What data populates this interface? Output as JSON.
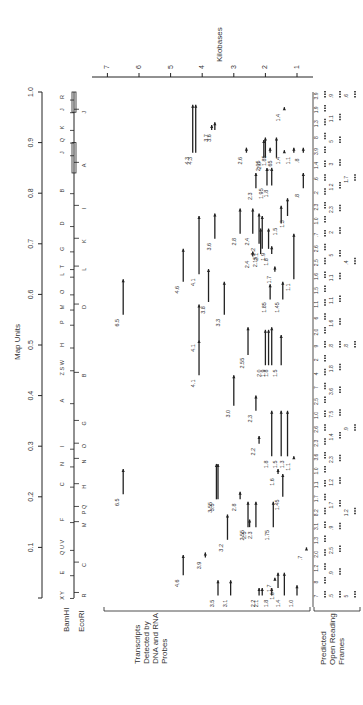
{
  "figure": {
    "map_units_label": "Map Units",
    "kilobases_label": "Kilobases",
    "bamhi_label": "BamHI",
    "ecori_label": "EcoRI",
    "transcripts_label": [
      "Transcripts",
      "Detected by",
      "DNA and RNA",
      "Probes"
    ],
    "orf_label": [
      "Predicted",
      "Open Reading",
      "Frames"
    ]
  },
  "map_units_axis": {
    "ticks": [
      "0",
      "0.1",
      "0.2",
      "0.3",
      "0.4",
      "0.5",
      "0.6",
      "0.7",
      "0.8",
      "0.9",
      "1.0"
    ],
    "tick_labels_shown": [
      "0.1",
      "0.2",
      "0.3",
      "0.4",
      "0.5",
      "0.6",
      "0.7",
      "0.8",
      "0.9",
      "1.0"
    ]
  },
  "kilobase_axis": {
    "ticks": [
      "7",
      "6",
      "5",
      "4",
      "3",
      "2",
      "1"
    ]
  },
  "bamhi_fragments": [
    {
      "label": "X Y",
      "pos": 0.005
    },
    {
      "label": "E",
      "pos": 0.05
    },
    {
      "label": "Q U V",
      "pos": 0.1
    },
    {
      "label": "F",
      "pos": 0.155
    },
    {
      "label": "C",
      "pos": 0.225
    },
    {
      "label": "N",
      "pos": 0.265
    },
    {
      "label": "I",
      "pos": 0.3
    },
    {
      "label": "A",
      "pos": 0.39
    },
    {
      "label": "Z S W",
      "pos": 0.455
    },
    {
      "label": "H",
      "pos": 0.5
    },
    {
      "label": "P",
      "pos": 0.545
    },
    {
      "label": "M",
      "pos": 0.575
    },
    {
      "label": "O",
      "pos": 0.605
    },
    {
      "label": "L",
      "pos": 0.64
    },
    {
      "label": "T",
      "pos": 0.655
    },
    {
      "label": "G",
      "pos": 0.69
    },
    {
      "label": "D",
      "pos": 0.74
    },
    {
      "label": "B",
      "pos": 0.805
    },
    {
      "label": "J",
      "pos": 0.88
    },
    {
      "label": "Q",
      "pos": 0.905
    },
    {
      "label": "K",
      "pos": 0.93
    },
    {
      "label": "J",
      "pos": 0.965
    },
    {
      "label": "R",
      "pos": 0.99
    }
  ],
  "ecori_fragments": [
    {
      "label": "R",
      "pos": 0.005
    },
    {
      "label": "C",
      "pos": 0.065
    },
    {
      "label": "M",
      "pos": 0.145
    },
    {
      "label": "P Q",
      "pos": 0.175
    },
    {
      "label": "H",
      "pos": 0.22
    },
    {
      "label": "N",
      "pos": 0.27
    },
    {
      "label": "O",
      "pos": 0.3
    },
    {
      "label": "G",
      "pos": 0.345
    },
    {
      "label": "B",
      "pos": 0.44
    },
    {
      "label": "D",
      "pos": 0.575
    },
    {
      "label": "L",
      "pos": 0.65
    },
    {
      "label": "K",
      "pos": 0.705
    },
    {
      "label": "I",
      "pos": 0.77
    },
    {
      "label": "A",
      "pos": 0.855
    },
    {
      "label": "J",
      "pos": 0.96
    }
  ],
  "transcripts": [
    {
      "size": "6.5",
      "from": 0.205,
      "to": 0.255
    },
    {
      "size": "6.5",
      "from": 0.56,
      "to": 0.63
    },
    {
      "size": "4.6",
      "from": 0.045,
      "to": 0.085
    },
    {
      "size": "4.6",
      "from": 0.625,
      "to": 0.69
    },
    {
      "size": "4.3",
      "from": 0.88,
      "to": 0.975
    },
    {
      "size": "4.3",
      "from": 0.88,
      "to": 0.975
    },
    {
      "size": "4.1",
      "from": 0.64,
      "to": 0.755
    },
    {
      "size": "4.1",
      "from": 0.44,
      "to": 0.51
    },
    {
      "size": "4.1",
      "from": 0.51,
      "to": 0.58
    },
    {
      "size": "3.9",
      "from": 0.08,
      "to": 0.09
    },
    {
      "size": "3.8",
      "from": 0.585,
      "to": 0.65
    },
    {
      "size": "3.7",
      "from": 0.925,
      "to": 0.935
    },
    {
      "size": "3.6",
      "from": 0.925,
      "to": 0.94
    },
    {
      "size": "3.6",
      "from": 0.71,
      "to": 0.76
    },
    {
      "size": "3.55",
      "from": 0.195,
      "to": 0.265
    },
    {
      "size": "3.5",
      "from": 0.195,
      "to": 0.265
    },
    {
      "size": "3.5",
      "from": 0.005,
      "to": 0.035
    },
    {
      "size": "3.3",
      "from": 0.56,
      "to": 0.625
    },
    {
      "size": "3.2",
      "from": 0.115,
      "to": 0.165
    },
    {
      "size": "3.1",
      "from": 0.005,
      "to": 0.035
    },
    {
      "size": "3.0",
      "from": 0.38,
      "to": 0.44
    },
    {
      "size": "2.8",
      "from": 0.195,
      "to": 0.21
    },
    {
      "size": "2.8",
      "from": 0.72,
      "to": 0.77
    },
    {
      "size": "2.6",
      "from": 0.88,
      "to": 0.89
    },
    {
      "size": "2.55",
      "from": 0.14,
      "to": 0.19
    },
    {
      "size": "2.55",
      "from": 0.48,
      "to": 0.535
    },
    {
      "size": "2.5",
      "from": 0.14,
      "to": 0.155
    },
    {
      "size": "2.4",
      "from": 0.675,
      "to": 0.685
    },
    {
      "size": "2.4",
      "from": 0.72,
      "to": 0.77
    },
    {
      "size": "2.3",
      "from": 0.14,
      "to": 0.19
    },
    {
      "size": "2.3",
      "from": 0.37,
      "to": 0.4
    },
    {
      "size": "2.3",
      "from": 0.81,
      "to": 0.84
    },
    {
      "size": "2.2",
      "from": 0.005,
      "to": 0.02
    },
    {
      "size": "2.2",
      "from": 0.305,
      "to": 0.32
    },
    {
      "size": "2.2",
      "from": 0.7,
      "to": 0.76
    },
    {
      "size": "2.15",
      "from": 0.68,
      "to": 0.73
    },
    {
      "size": "2.1",
      "from": 0.005,
      "to": 0.02
    },
    {
      "size": "2.1",
      "from": 0.69,
      "to": 0.755
    },
    {
      "size": "2.05",
      "from": 0.87,
      "to": 0.905
    },
    {
      "size": "2.0",
      "from": 0.87,
      "to": 0.91
    },
    {
      "size": "2.0",
      "from": 0.46,
      "to": 0.53
    },
    {
      "size": "1.95",
      "from": 0.815,
      "to": 0.85
    },
    {
      "size": "1.9",
      "from": 0.46,
      "to": 0.53
    },
    {
      "size": "1.9",
      "from": 0.69,
      "to": 0.73
    },
    {
      "size": "1.85",
      "from": 0.88,
      "to": 0.89
    },
    {
      "size": "1.85",
      "from": 0.59,
      "to": 0.62
    },
    {
      "size": "1.8",
      "from": 0.005,
      "to": 0.02
    },
    {
      "size": "1.8",
      "from": 0.28,
      "to": 0.37
    },
    {
      "size": "1.8",
      "from": 0.46,
      "to": 0.535
    },
    {
      "size": "1.8",
      "from": 0.815,
      "to": 0.85
    },
    {
      "size": "1.8",
      "from": 0.68,
      "to": 0.695
    },
    {
      "size": "1.75",
      "from": 0.14,
      "to": 0.19
    },
    {
      "size": "1.7",
      "from": 0.035,
      "to": 0.04
    },
    {
      "size": "1.7",
      "from": 0.645,
      "to": 0.655
    },
    {
      "size": "1.65",
      "from": 0.87,
      "to": 0.91
    },
    {
      "size": "1.6",
      "from": 0.02,
      "to": 0.05
    },
    {
      "size": "1.6",
      "from": 0.245,
      "to": 0.255
    },
    {
      "size": "1.5",
      "from": 0.28,
      "to": 0.37
    },
    {
      "size": "1.5",
      "from": 0.46,
      "to": 0.52
    },
    {
      "size": "1.5",
      "from": 0.74,
      "to": 0.775
    },
    {
      "size": "1.45",
      "from": 0.2,
      "to": 0.245
    },
    {
      "size": "1.45",
      "from": 0.59,
      "to": 0.625
    },
    {
      "size": "1.4",
      "from": 0.005,
      "to": 0.05
    },
    {
      "size": "1.4",
      "from": 0.88,
      "to": 0.885
    },
    {
      "size": "1.4",
      "from": 0.965,
      "to": 0.97
    },
    {
      "size": "1.3",
      "from": 0.28,
      "to": 0.37
    },
    {
      "size": "1.3",
      "from": 0.755,
      "to": 0.79
    },
    {
      "size": "1.1",
      "from": 0.275,
      "to": 0.28
    },
    {
      "size": "1.1",
      "from": 0.63,
      "to": 0.72
    },
    {
      "size": "1.1",
      "from": 0.88,
      "to": 0.89
    },
    {
      "size": "1.0",
      "from": 0.005,
      "to": 0.025
    },
    {
      "size": ".8",
      "from": 0.81,
      "to": 0.84
    },
    {
      "size": ".8",
      "from": 0.88,
      "to": 0.89
    },
    {
      "size": ".7",
      "from": 0.095,
      "to": 0.1
    }
  ],
  "orf_labels_row1": [
    "7",
    "8",
    "1.2",
    "2.0",
    "1.3",
    "3.1",
    "8.2",
    "1.7",
    "1.1",
    "1.0",
    "3.6",
    "2.3",
    "2.6",
    "1.0",
    "2.5",
    "7",
    "4",
    "2",
    "9",
    "2.0",
    "6",
    "1.1",
    "1.5",
    "1.6",
    "2.5",
    "2.6",
    ".7",
    "1.0",
    "2.3",
    ".2",
    ".6",
    "1.4",
    "3.9",
    "8",
    "1.3",
    "1.9",
    "3.9"
  ],
  "orf_labels_row2": [
    ".5",
    ".9",
    "2.5",
    ".9",
    "1.7",
    "1.2",
    "2.3",
    "1.4",
    "7.5",
    "3.6",
    "1.8",
    ".8",
    "1.6",
    "1.1",
    "1.1",
    "5",
    "2",
    "2.3",
    "1.2",
    "3",
    "5",
    "1.1",
    ".9"
  ],
  "orf_labels_row3": [
    "5",
    "1.2",
    ".9",
    ".8",
    ".4",
    "1.7",
    ".6"
  ],
  "colors": {
    "ink": "#222222",
    "text": "#333333",
    "background": "#ffffff"
  }
}
